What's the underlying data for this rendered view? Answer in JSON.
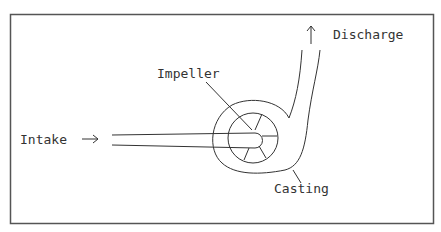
{
  "diagram": {
    "type": "centrifugal-pump-schematic",
    "labels": {
      "intake": "Intake",
      "impeller": "Impeller",
      "discharge": "Discharge",
      "casting": "Casting"
    },
    "arrows": {
      "intake_arrow": "→",
      "discharge_arrow": "↑"
    },
    "colors": {
      "line": "#333333",
      "frame": "#555555",
      "background": "#ffffff"
    }
  }
}
